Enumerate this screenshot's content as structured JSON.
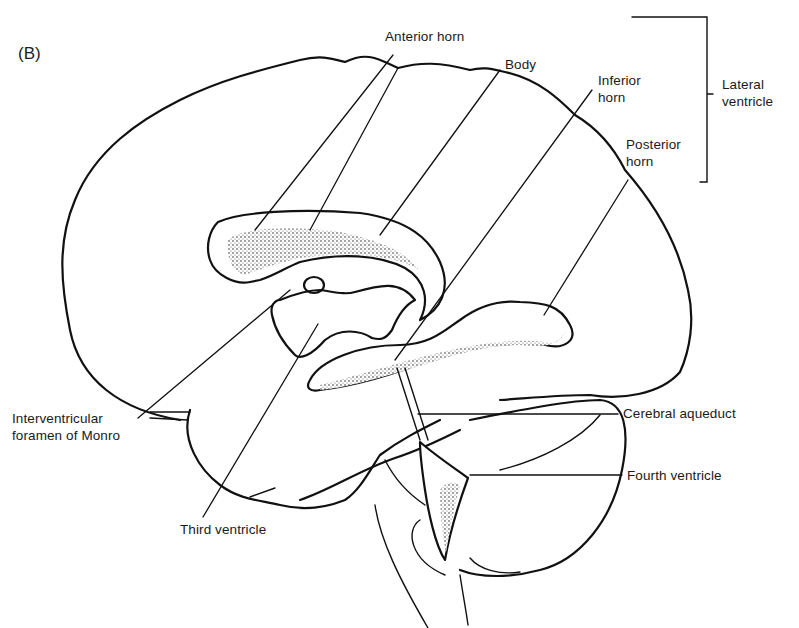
{
  "figure": {
    "panel_label": "(B)",
    "colors": {
      "line": "#111111",
      "background": "#ffffff"
    }
  },
  "labels": {
    "anterior_horn": "Anterior horn",
    "body": "Body",
    "inferior_horn": [
      "Inferior",
      "horn"
    ],
    "posterior_horn": [
      "Posterior",
      "horn"
    ],
    "lateral_ventricle": [
      "Lateral",
      "ventricle"
    ],
    "interventricular_foramen": [
      "Interventricular",
      "foramen of Monro"
    ],
    "third_ventricle": "Third ventricle",
    "cerebral_aqueduct": "Cerebral aqueduct",
    "fourth_ventricle": "Fourth ventricle"
  }
}
